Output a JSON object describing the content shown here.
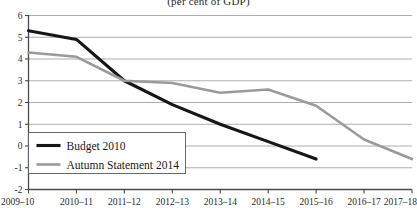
{
  "chart_data": {
    "type": "line",
    "title": "(per cent of GDP)",
    "xlabel": "",
    "ylabel": "",
    "ylim": [
      -2,
      6
    ],
    "yticks": [
      6,
      5,
      4,
      3,
      2,
      1,
      0,
      -1,
      -2
    ],
    "ytick_labels": [
      "6",
      "5",
      "4",
      "3",
      "2",
      "1",
      "0",
      "-1",
      "-2"
    ],
    "grid": true,
    "legend_position": "bottom-left",
    "categories": [
      "2009–10",
      "2010–11",
      "2011–12",
      "2012–13",
      "2013–14",
      "2014–15",
      "2015–16",
      "2016–17",
      "2017–18"
    ],
    "series": [
      {
        "name": "Budget 2010",
        "color": "#161616",
        "values": [
          5.3,
          4.9,
          3.0,
          1.9,
          1.0,
          0.2,
          -0.6,
          null,
          null
        ]
      },
      {
        "name": "Autumn Statement 2014",
        "color": "#9a9a9a",
        "values": [
          4.3,
          4.1,
          3.0,
          2.9,
          2.45,
          2.6,
          1.85,
          0.3,
          -0.6
        ]
      }
    ]
  },
  "legend": {
    "entries": [
      {
        "label": "Budget 2010"
      },
      {
        "label": "Autumn Statement 2014"
      }
    ]
  }
}
